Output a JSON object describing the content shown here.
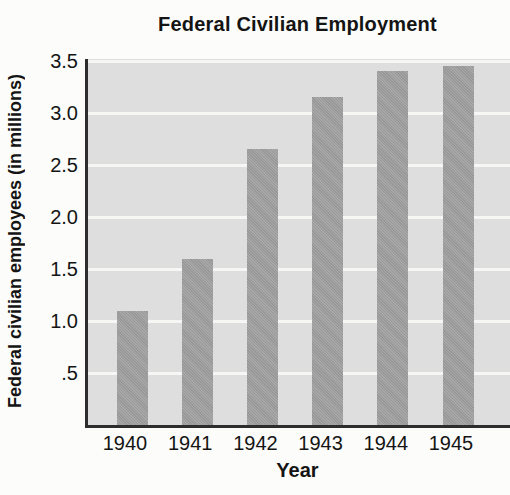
{
  "chart_data": {
    "type": "bar",
    "title": "Federal Civilian Employment",
    "xlabel": "Year",
    "ylabel": "Federal civilian employees (in millions)",
    "categories": [
      "1940",
      "1941",
      "1942",
      "1943",
      "1944",
      "1945"
    ],
    "values": [
      1.1,
      1.6,
      2.65,
      3.15,
      3.4,
      3.45
    ],
    "ylim": [
      0,
      3.5
    ],
    "yticks": [
      ".5",
      "1.0",
      "1.5",
      "2.0",
      "2.5",
      "3.0",
      "3.5"
    ],
    "ytick_values": [
      0.5,
      1.0,
      1.5,
      2.0,
      2.5,
      3.0,
      3.5
    ],
    "grid": true,
    "gridline_orientation": "horizontal",
    "legend": "none",
    "colors": {
      "bar": "#a1a1a1",
      "plot_background": "#dedede",
      "gridline": "#f6f6f4",
      "axis": "#2d2d2d",
      "text": "#141414",
      "page_background": "#fcfcfa"
    }
  }
}
